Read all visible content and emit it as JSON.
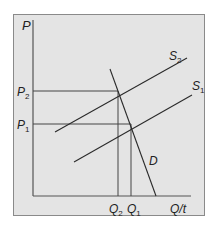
{
  "diagram": {
    "type": "supply-demand",
    "background": "#e4e4e4",
    "frame_color": "#8a8a8a",
    "line_color": "#2a2a2a",
    "axes": {
      "y_label": "P",
      "x_label": "Q/t"
    },
    "price_levels": [
      {
        "name": "P",
        "sub": "2",
        "y": 91
      },
      {
        "name": "P",
        "sub": "1",
        "y": 124
      }
    ],
    "quantity_levels": [
      {
        "name": "Q",
        "sub": "2",
        "x": 118
      },
      {
        "name": "Q",
        "sub": "1",
        "x": 131
      }
    ],
    "curves": [
      {
        "name": "S",
        "sub": "2",
        "x1": 55,
        "y1": 132,
        "x2": 187,
        "y2": 58
      },
      {
        "name": "S",
        "sub": "1",
        "x1": 74,
        "y1": 162,
        "x2": 192,
        "y2": 95
      },
      {
        "name": "D",
        "sub": "",
        "x1": 110,
        "y1": 69,
        "x2": 156,
        "y2": 196
      }
    ],
    "equilibria": [
      {
        "label": "E2",
        "x": 118,
        "y": 91
      },
      {
        "label": "E1",
        "x": 131,
        "y": 124
      }
    ]
  }
}
